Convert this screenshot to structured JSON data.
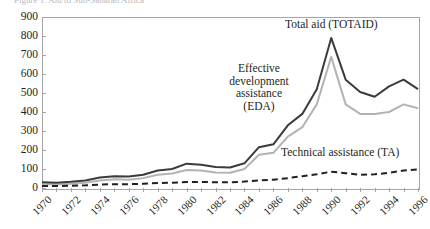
{
  "title_strip": "Figure 1. Aid to Sub-Saharan Africa",
  "chart_data": {
    "type": "line",
    "title": "",
    "xlabel": "",
    "ylabel": "",
    "ylim": [
      0,
      900
    ],
    "xlim": [
      1970,
      1996
    ],
    "ytick_step": 100,
    "yticks": [
      900,
      800,
      700,
      600,
      500,
      400,
      300,
      200,
      100,
      0
    ],
    "xticks": [
      1970,
      1972,
      1974,
      1976,
      1978,
      1980,
      1982,
      1984,
      1986,
      1988,
      1990,
      1992,
      1994,
      1996
    ],
    "x": [
      1970,
      1971,
      1972,
      1973,
      1974,
      1975,
      1976,
      1977,
      1978,
      1979,
      1980,
      1981,
      1982,
      1983,
      1984,
      1985,
      1986,
      1987,
      1988,
      1989,
      1990,
      1991,
      1992,
      1993,
      1994,
      1995,
      1996
    ],
    "grid": false,
    "legend_position": "inline-annotations",
    "series": [
      {
        "name": "Total aid (TOTAID)",
        "color": "#3b3b3b",
        "style": "solid",
        "width": 2.0,
        "values": [
          30,
          28,
          33,
          40,
          55,
          62,
          60,
          70,
          92,
          100,
          128,
          122,
          110,
          108,
          130,
          215,
          230,
          330,
          390,
          520,
          790,
          570,
          505,
          480,
          535,
          570,
          520
        ]
      },
      {
        "name": "Effective development assistance (EDA)",
        "color": "#b3b3b3",
        "style": "solid",
        "width": 2.0,
        "values": [
          20,
          18,
          22,
          28,
          40,
          46,
          44,
          52,
          70,
          76,
          95,
          92,
          82,
          80,
          100,
          175,
          185,
          270,
          320,
          440,
          690,
          440,
          390,
          390,
          400,
          440,
          420
        ]
      },
      {
        "name": "Technical assistance (TA)",
        "color": "#231f20",
        "style": "dashed",
        "width": 2.0,
        "values": [
          10,
          10,
          12,
          14,
          18,
          20,
          20,
          22,
          26,
          28,
          32,
          32,
          30,
          30,
          34,
          40,
          44,
          52,
          62,
          72,
          86,
          78,
          70,
          72,
          80,
          92,
          98
        ]
      }
    ],
    "annotations": [
      {
        "id": "totaid",
        "text": "Total aid (TOTAID)"
      },
      {
        "id": "eda",
        "text": "Effective\ndevelopment\nassistance\n(EDA)"
      },
      {
        "id": "ta",
        "text": "Technical assistance (TA)"
      }
    ]
  }
}
